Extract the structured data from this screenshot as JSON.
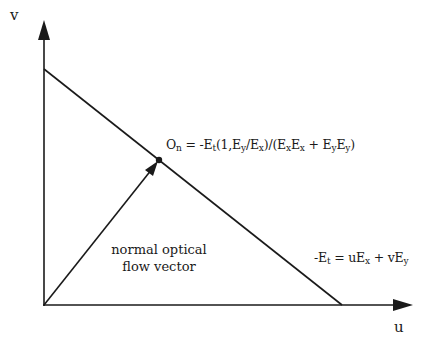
{
  "diagram": {
    "axes": {
      "x_label": "u",
      "y_label": "v"
    },
    "constraint_line": {
      "equation": {
        "lhs": "-E",
        "lhs_sub": "t",
        "eq": " = uE",
        "sub1": "x",
        "plus": " + vE",
        "sub2": "y"
      }
    },
    "normal_point": {
      "equation": {
        "p1": "O",
        "s1": "n",
        "p2": " = -E",
        "s2": "t",
        "p3": "(1,E",
        "s3": "y",
        "p4": "/E",
        "s4": "x",
        "p5": ")/(E",
        "s5": "x",
        "p6": "E",
        "s6": "x",
        "p7": " + E",
        "s7": "y",
        "p8": "E",
        "s8": "y",
        "p9": ")"
      }
    },
    "vector_caption": {
      "line1": "normal optical",
      "line2": "flow vector"
    },
    "colors": {
      "stroke": "#1a1a1a",
      "background": "#ffffff"
    }
  }
}
